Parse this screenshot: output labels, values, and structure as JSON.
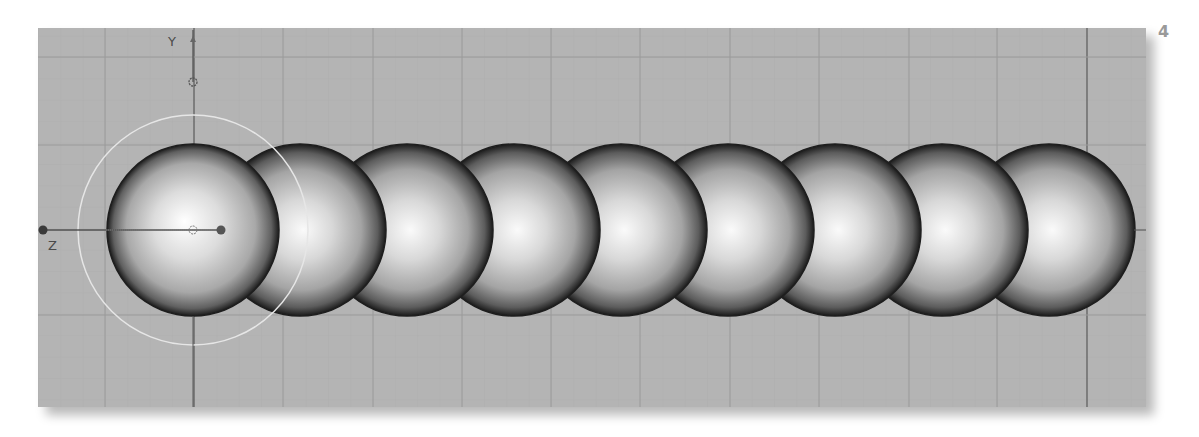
{
  "page": {
    "step_number": "4"
  },
  "viewport": {
    "view": "side",
    "background_color": "#b4b4b4",
    "grid": {
      "minor_color": "#a7a7a7",
      "major_color": "#9a9a9a",
      "axis_color": "#5a5a5a",
      "vertical_lines_x": [
        67,
        156,
        245,
        335,
        424,
        513,
        602,
        692,
        781,
        871,
        959,
        1049
      ],
      "horizontal_lines_y": [
        29,
        117,
        202,
        287
      ]
    },
    "axes": {
      "y_label": "Y",
      "z_label": "Z"
    },
    "selection_circle": {
      "cx": 155,
      "cy": 202,
      "r": 115,
      "color": "#e6e6e6"
    },
    "objects": {
      "type": "sphere",
      "count": 9,
      "radius": 86,
      "centers_x": [
        155,
        262,
        369,
        476,
        583,
        690,
        797,
        904,
        1011
      ],
      "center_y": 202
    }
  }
}
